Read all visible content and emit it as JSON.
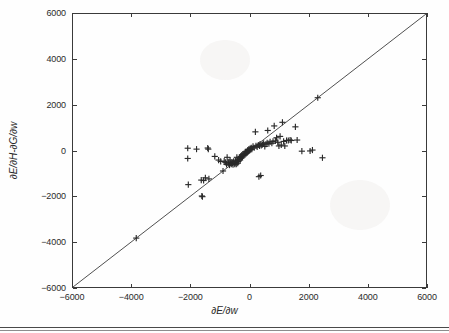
{
  "figure": {
    "axis_color": "#3a3a3a",
    "marker_color": "#2a2a2a",
    "line_color": "#3a3a3a"
  },
  "axes": {
    "x_tick_labels": [
      "-6000",
      "-4000",
      "-2000",
      "0",
      "2000",
      "4000",
      "6000"
    ],
    "y_tick_labels": [
      "6000",
      "4000",
      "2000",
      "0",
      "-2000",
      "-4000",
      "-6000"
    ],
    "xlabel": "∂E/∂w",
    "ylabel": "∂E/∂H-∂G/∂w"
  },
  "chart_data": {
    "type": "scatter",
    "title": "",
    "xlabel": "∂E/∂w",
    "ylabel": "∂E/∂H-∂G/∂w",
    "xlim": [
      -6000,
      6000
    ],
    "ylim": [
      -6000,
      6000
    ],
    "xticks": [
      -6000,
      -4000,
      -2000,
      0,
      2000,
      4000,
      6000
    ],
    "yticks": [
      -6000,
      -4000,
      -2000,
      0,
      2000,
      4000,
      6000
    ],
    "grid": false,
    "legend": null,
    "marker": "+",
    "reference_line": {
      "type": "identity",
      "equation": "y = x",
      "from": [
        -6000,
        -6000
      ],
      "to": [
        6000,
        6000
      ]
    },
    "points": [
      [
        -3850,
        -3850
      ],
      [
        -2100,
        100
      ],
      [
        -2100,
        -350
      ],
      [
        -2080,
        -1500
      ],
      [
        -1800,
        60
      ],
      [
        -1640,
        -1300
      ],
      [
        -1620,
        -2000
      ],
      [
        -1600,
        -2030
      ],
      [
        -1560,
        -1320
      ],
      [
        -1500,
        -1200
      ],
      [
        -1420,
        110
      ],
      [
        -1400,
        60
      ],
      [
        -1380,
        -1250
      ],
      [
        -1180,
        -260
      ],
      [
        -1050,
        -420
      ],
      [
        -980,
        -480
      ],
      [
        -900,
        -900
      ],
      [
        -860,
        -470
      ],
      [
        -820,
        -520
      ],
      [
        -780,
        -610
      ],
      [
        -760,
        -300
      ],
      [
        -720,
        -560
      ],
      [
        -700,
        -500
      ],
      [
        -680,
        -640
      ],
      [
        -660,
        -420
      ],
      [
        -640,
        -560
      ],
      [
        -620,
        -600
      ],
      [
        -600,
        -520
      ],
      [
        -580,
        -560
      ],
      [
        -560,
        -620
      ],
      [
        -540,
        -480
      ],
      [
        -520,
        -560
      ],
      [
        -500,
        -600
      ],
      [
        -480,
        -460
      ],
      [
        -470,
        -530
      ],
      [
        -450,
        -600
      ],
      [
        -430,
        -300
      ],
      [
        -410,
        -420
      ],
      [
        -400,
        -560
      ],
      [
        -380,
        -480
      ],
      [
        -360,
        -380
      ],
      [
        -340,
        -300
      ],
      [
        -320,
        -420
      ],
      [
        -300,
        -260
      ],
      [
        -280,
        -340
      ],
      [
        -260,
        -200
      ],
      [
        -240,
        -280
      ],
      [
        -220,
        -160
      ],
      [
        -200,
        -220
      ],
      [
        -180,
        -120
      ],
      [
        -160,
        -180
      ],
      [
        -140,
        -60
      ],
      [
        -120,
        -140
      ],
      [
        -100,
        -60
      ],
      [
        -80,
        -100
      ],
      [
        -60,
        20
      ],
      [
        -40,
        -40
      ],
      [
        -20,
        60
      ],
      [
        0,
        0
      ],
      [
        20,
        80
      ],
      [
        40,
        40
      ],
      [
        60,
        120
      ],
      [
        80,
        60
      ],
      [
        120,
        180
      ],
      [
        160,
        120
      ],
      [
        200,
        820
      ],
      [
        220,
        200
      ],
      [
        260,
        160
      ],
      [
        300,
        240
      ],
      [
        320,
        -1150
      ],
      [
        340,
        200
      ],
      [
        360,
        280
      ],
      [
        380,
        -1100
      ],
      [
        400,
        220
      ],
      [
        440,
        260
      ],
      [
        480,
        320
      ],
      [
        520,
        180
      ],
      [
        560,
        280
      ],
      [
        600,
        340
      ],
      [
        620,
        880
      ],
      [
        660,
        300
      ],
      [
        700,
        380
      ],
      [
        760,
        320
      ],
      [
        800,
        400
      ],
      [
        840,
        1080
      ],
      [
        880,
        420
      ],
      [
        920,
        560
      ],
      [
        960,
        360
      ],
      [
        1000,
        200
      ],
      [
        1040,
        620
      ],
      [
        1080,
        240
      ],
      [
        1120,
        1240
      ],
      [
        1160,
        400
      ],
      [
        1200,
        200
      ],
      [
        1260,
        440
      ],
      [
        1320,
        440
      ],
      [
        1380,
        460
      ],
      [
        1420,
        440
      ],
      [
        1560,
        1040
      ],
      [
        1620,
        460
      ],
      [
        1780,
        -30
      ],
      [
        2060,
        -20
      ],
      [
        2140,
        20
      ],
      [
        2320,
        2320
      ],
      [
        2480,
        -320
      ]
    ]
  }
}
